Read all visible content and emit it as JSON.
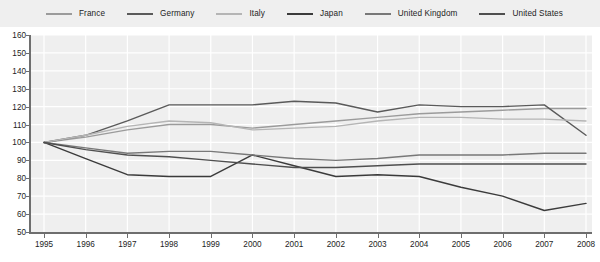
{
  "chart_data": {
    "type": "line",
    "title": "",
    "subtitle": "",
    "xlabel": "",
    "ylabel": "",
    "x": [
      1995,
      1996,
      1997,
      1998,
      1999,
      2000,
      2001,
      2002,
      2003,
      2004,
      2005,
      2006,
      2007,
      2008
    ],
    "xtick_labels": [
      "1995",
      "1996",
      "1997",
      "1998",
      "1999",
      "2000",
      "2001",
      "2002",
      "2003",
      "2004",
      "2005",
      "2006",
      "2007",
      "2008"
    ],
    "ytick_labels": [
      "50",
      "60",
      "70",
      "80",
      "90",
      "100",
      "110",
      "120",
      "130",
      "140",
      "150",
      "160"
    ],
    "ylim": [
      50,
      160
    ],
    "ytick_step": 10,
    "xlim": [
      1995,
      2008
    ],
    "grid": true,
    "grid_color": "#ffffff",
    "plot_background": "#efefef",
    "legend_position": "top",
    "legend_background": "#efefef",
    "series": [
      {
        "name": "France",
        "color": "#9b9b9b",
        "values": [
          100,
          103,
          107,
          110,
          110,
          108,
          110,
          112,
          114,
          116,
          117,
          118,
          119,
          119
        ]
      },
      {
        "name": "Germany",
        "color": "#5a5a5a",
        "values": [
          100,
          104,
          112,
          121,
          121,
          121,
          123,
          122,
          117,
          121,
          120,
          120,
          121,
          104
        ]
      },
      {
        "name": "Italy",
        "color": "#b5b5b5",
        "values": [
          100,
          104,
          109,
          112,
          111,
          107,
          108,
          109,
          112,
          114,
          114,
          113,
          113,
          112
        ]
      },
      {
        "name": "Japan",
        "color": "#3b3b3b",
        "values": [
          100,
          91,
          82,
          81,
          81,
          93,
          87,
          81,
          82,
          81,
          75,
          70,
          62,
          66
        ]
      },
      {
        "name": "United Kingdom",
        "color": "#787878",
        "values": [
          100,
          97,
          94,
          95,
          95,
          93,
          91,
          90,
          91,
          93,
          93,
          93,
          94,
          94
        ]
      },
      {
        "name": "United States",
        "color": "#4f4f4f",
        "values": [
          100,
          96,
          93,
          92,
          90,
          88,
          86,
          86,
          87,
          88,
          88,
          88,
          88,
          88
        ]
      }
    ]
  },
  "legend": {
    "items": [
      {
        "label": "France"
      },
      {
        "label": "Germany"
      },
      {
        "label": "Italy"
      },
      {
        "label": "Japan"
      },
      {
        "label": "United Kingdom"
      },
      {
        "label": "United States"
      }
    ]
  }
}
